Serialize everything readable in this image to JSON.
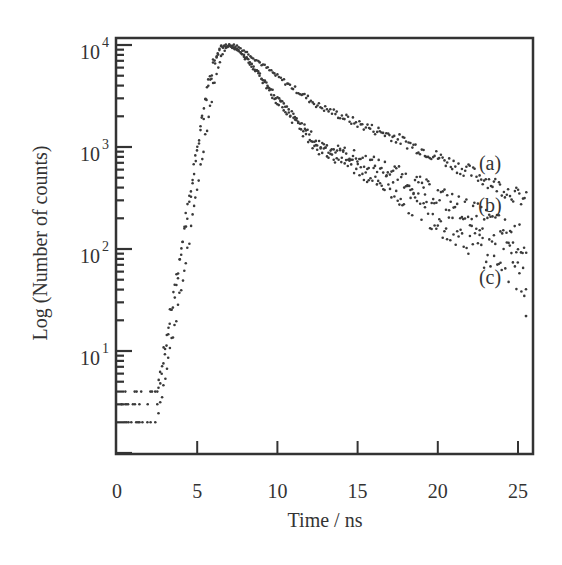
{
  "chart_data": {
    "type": "scatter",
    "title": "",
    "xlabel": "Time / ns",
    "ylabel": "Log (Number of counts)",
    "xlim": [
      0,
      26
    ],
    "ylim": [
      1,
      10000
    ],
    "yscale": "log",
    "grid": false,
    "legend": "inline labels at right end of curves",
    "x_ticks": [
      0,
      5,
      10,
      15,
      20,
      25
    ],
    "x_tick_labels": [
      "0",
      "5",
      "10",
      "15",
      "20",
      "25"
    ],
    "y_ticks": [
      10,
      100,
      1000,
      10000
    ],
    "y_tick_labels": [
      {
        "base": "10",
        "exp": "1"
      },
      {
        "base": "10",
        "exp": "2"
      },
      {
        "base": "10",
        "exp": "3"
      },
      {
        "base": "10",
        "exp": "4"
      }
    ],
    "series": [
      {
        "name": "(a)",
        "label": "(a)",
        "x": [
          0.5,
          1.5,
          2.5,
          3.0,
          3.5,
          4.0,
          4.5,
          5.0,
          5.5,
          6.0,
          6.5,
          7.0,
          7.5,
          8.3,
          10.0,
          12.5,
          15.0,
          17.0,
          20.0,
          23.0,
          25.5
        ],
        "y": [
          2,
          2,
          2,
          6,
          15,
          40,
          120,
          400,
          1300,
          3800,
          8000,
          10000,
          9800,
          8000,
          4900,
          2570,
          1700,
          1310,
          800,
          480,
          300
        ]
      },
      {
        "name": "(b)",
        "label": "(b)",
        "x": [
          0.5,
          1.5,
          2.5,
          3.0,
          3.5,
          4.0,
          4.5,
          5.0,
          5.5,
          6.0,
          6.5,
          7.0,
          7.5,
          8.3,
          10.0,
          12.5,
          15.0,
          17.0,
          20.0,
          23.0,
          25.5
        ],
        "y": [
          3,
          3,
          3,
          10,
          30,
          90,
          280,
          900,
          2600,
          6200,
          9600,
          9900,
          9200,
          6800,
          3000,
          1090,
          780,
          590,
          330,
          190,
          115
        ]
      },
      {
        "name": "(c)",
        "label": "(c)",
        "x": [
          0.5,
          1.5,
          2.5,
          3.0,
          3.5,
          4.0,
          4.5,
          5.0,
          5.5,
          6.0,
          6.5,
          7.0,
          7.5,
          8.3,
          10.0,
          12.5,
          15.0,
          17.0,
          20.0,
          23.0,
          25.5
        ],
        "y": [
          4,
          4,
          4,
          12,
          35,
          100,
          320,
          1000,
          2900,
          6600,
          9700,
          9900,
          9100,
          6600,
          2800,
          1000,
          620,
          400,
          200,
          100,
          55
        ]
      }
    ],
    "annotations": [
      {
        "text": "(a)",
        "x": 23.0,
        "y": 700
      },
      {
        "text": "(b)",
        "x": 23.0,
        "y": 270
      },
      {
        "text": "(c)",
        "x": 23.0,
        "y": 55
      }
    ],
    "outliers": [
      {
        "x": 25.5,
        "y": 22
      }
    ]
  }
}
